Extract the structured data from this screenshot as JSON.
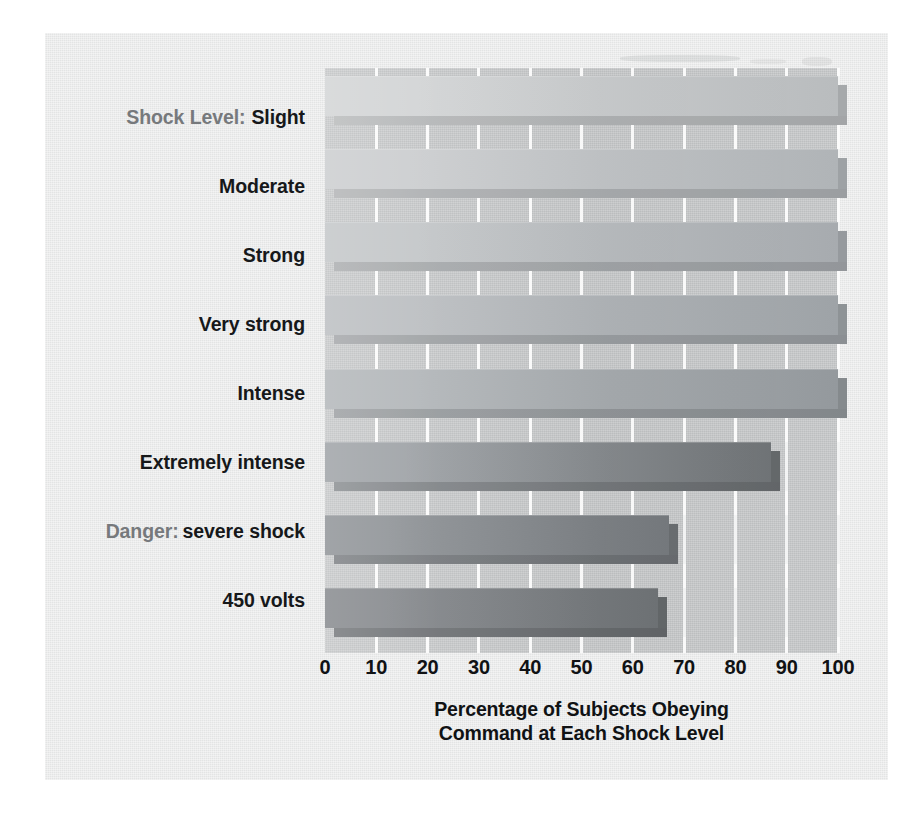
{
  "figure": {
    "legend_prefix": "Shock Level:",
    "danger_prefix": "Danger:",
    "xaxis_title_line1": "Percentage of Subjects Obeying",
    "xaxis_title_line2": "Command at Each Shock Level",
    "colors": {
      "card_background": "#e9eaea",
      "plot_background": "#c5c7c8",
      "gridline": "#f3f4f4",
      "tick_label": "#101214",
      "category_label": "#16181a",
      "prefix_label": "#76797c",
      "bar_lightest": "#d2d4d5",
      "bar_darkest": "#6e7275"
    }
  },
  "chart_data": {
    "type": "bar",
    "orientation": "horizontal",
    "title": "",
    "xlabel": "Percentage of Subjects Obeying Command at Each Shock Level",
    "ylabel": "Shock Level:",
    "xlim": [
      0,
      100
    ],
    "xticks": [
      0,
      10,
      20,
      30,
      40,
      50,
      60,
      70,
      80,
      90,
      100
    ],
    "tick_labels": [
      "0",
      "10",
      "20",
      "30",
      "40",
      "50",
      "60",
      "70",
      "80",
      "90",
      "100"
    ],
    "grid": true,
    "legend": false,
    "categories": [
      "Slight",
      "Moderate",
      "Strong",
      "Very strong",
      "Intense",
      "Extremely intense",
      "Danger: severe shock",
      "450 volts"
    ],
    "values": [
      100,
      100,
      100,
      100,
      100,
      87,
      67,
      65
    ],
    "bar_shades": [
      "#d2d4d5",
      "#cbcdcf",
      "#c3c6c8",
      "#bbbec1",
      "#b2b6b9",
      "#9ea2a6",
      "#8f9397",
      "#86898d"
    ],
    "bar_shade_ends": [
      "#b9bcbe",
      "#b0b4b7",
      "#a7abaf",
      "#9ea3a7",
      "#94999d",
      "#6f7376",
      "#75797d",
      "#6e7275"
    ]
  }
}
